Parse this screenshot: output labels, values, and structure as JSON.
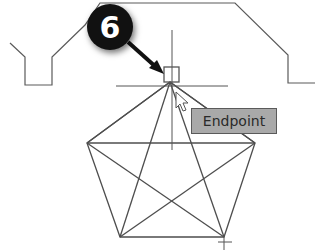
{
  "callout": {
    "number": "6",
    "color": "#111111"
  },
  "osnap_tooltip": {
    "label": "Endpoint",
    "background": "#a9a9a9"
  },
  "drawing": {
    "line_color": "#555555",
    "profile_outline": "stepped outline with notches",
    "shape": "pentagon with inscribed star diagonals",
    "crosshair": "cursor crosshair with snap marker"
  }
}
